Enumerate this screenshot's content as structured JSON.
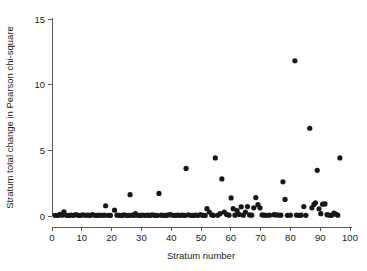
{
  "chart_data": {
    "type": "scatter",
    "title": "",
    "xlabel": "Stratum number",
    "ylabel": "Stratum total change in Pearson chi-square",
    "xlim": [
      0,
      100
    ],
    "ylim": [
      0,
      15
    ],
    "xticks": [
      0,
      10,
      20,
      30,
      40,
      50,
      60,
      70,
      80,
      90,
      100
    ],
    "yticks": [
      0,
      5,
      10,
      15
    ],
    "xtick_labels": [
      "0",
      "10",
      "20",
      "30",
      "40",
      "50",
      "60",
      "70",
      "80",
      "90",
      "100"
    ],
    "ytick_labels": [
      "0",
      "5",
      "10",
      "15"
    ],
    "grid": false,
    "legend": "none",
    "marker": "filled-circle",
    "marker_color": "#171717",
    "marker_size": 2.6,
    "series": [
      {
        "name": "Stratum total change in Pearson chi-square",
        "points": [
          [
            1,
            0.05
          ],
          [
            2,
            0.04
          ],
          [
            2.7,
            0.12
          ],
          [
            3.4,
            0.06
          ],
          [
            4,
            0.32
          ],
          [
            4.8,
            0.05
          ],
          [
            5.6,
            0.04
          ],
          [
            6.4,
            0.07
          ],
          [
            7.2,
            0.05
          ],
          [
            8,
            0.1
          ],
          [
            8.8,
            0.05
          ],
          [
            9.6,
            0.04
          ],
          [
            10.4,
            0.09
          ],
          [
            11.2,
            0.05
          ],
          [
            12,
            0.06
          ],
          [
            12.8,
            0.04
          ],
          [
            13.6,
            0.1
          ],
          [
            14.4,
            0.05
          ],
          [
            15.2,
            0.04
          ],
          [
            16,
            0.07
          ],
          [
            16.8,
            0.05
          ],
          [
            17.6,
            0.06
          ],
          [
            18,
            0.78
          ],
          [
            18.8,
            0.05
          ],
          [
            19.6,
            0.04
          ],
          [
            21,
            0.44
          ],
          [
            21.8,
            0.06
          ],
          [
            22.6,
            0.05
          ],
          [
            23.4,
            0.04
          ],
          [
            24.2,
            0.08
          ],
          [
            25,
            0.05
          ],
          [
            25.8,
            0.04
          ],
          [
            26.2,
            1.62
          ],
          [
            26.9,
            0.06
          ],
          [
            27.6,
            0.05
          ],
          [
            28,
            0.18
          ],
          [
            28.8,
            0.05
          ],
          [
            29.6,
            0.04
          ],
          [
            30.4,
            0.07
          ],
          [
            31.2,
            0.05
          ],
          [
            32,
            0.06
          ],
          [
            32.8,
            0.04
          ],
          [
            33.6,
            0.09
          ],
          [
            34.4,
            0.05
          ],
          [
            35.2,
            0.04
          ],
          [
            35.9,
            1.72
          ],
          [
            36.6,
            0.06
          ],
          [
            37.4,
            0.05
          ],
          [
            38.2,
            0.04
          ],
          [
            39,
            0.08
          ],
          [
            39.8,
            0.11
          ],
          [
            40.6,
            0.05
          ],
          [
            41.4,
            0.04
          ],
          [
            42.2,
            0.07
          ],
          [
            43,
            0.05
          ],
          [
            43.8,
            0.06
          ],
          [
            44.6,
            0.04
          ],
          [
            45,
            3.62
          ],
          [
            45.8,
            0.09
          ],
          [
            46.6,
            0.05
          ],
          [
            47.4,
            0.04
          ],
          [
            48.2,
            0.07
          ],
          [
            49,
            0.05
          ],
          [
            49.8,
            0.1
          ],
          [
            50.6,
            0.05
          ],
          [
            51.4,
            0.04
          ],
          [
            52,
            0.56
          ],
          [
            52.8,
            0.3
          ],
          [
            53.6,
            0.08
          ],
          [
            54.2,
            0.05
          ],
          [
            54.8,
            4.42
          ],
          [
            55.6,
            0.05
          ],
          [
            56.4,
            0.18
          ],
          [
            57,
            2.82
          ],
          [
            57.8,
            0.3
          ],
          [
            58.6,
            0.12
          ],
          [
            59.4,
            0.06
          ],
          [
            60.1,
            1.38
          ],
          [
            60.8,
            0.56
          ],
          [
            61.4,
            0.06
          ],
          [
            62.1,
            0.42
          ],
          [
            62.8,
            0.12
          ],
          [
            63.5,
            0.7
          ],
          [
            64.2,
            0.06
          ],
          [
            64.9,
            0.3
          ],
          [
            65.6,
            0.72
          ],
          [
            66.3,
            0.08
          ],
          [
            67,
            0.06
          ],
          [
            67.7,
            0.62
          ],
          [
            68.4,
            1.4
          ],
          [
            69.1,
            0.86
          ],
          [
            69.8,
            0.62
          ],
          [
            70.5,
            0.08
          ],
          [
            71.2,
            0.06
          ],
          [
            72,
            0.05
          ],
          [
            73,
            0.06
          ],
          [
            74.5,
            0.1
          ],
          [
            75.2,
            0.08
          ],
          [
            76,
            0.07
          ],
          [
            76.8,
            0.06
          ],
          [
            77.5,
            2.6
          ],
          [
            78.2,
            1.26
          ],
          [
            79,
            0.05
          ],
          [
            80,
            0.06
          ],
          [
            81.5,
            11.82
          ],
          [
            82,
            0.07
          ],
          [
            82.8,
            0.05
          ],
          [
            83.6,
            0.06
          ],
          [
            84.5,
            0.72
          ],
          [
            85.2,
            0.05
          ],
          [
            86.5,
            6.68
          ],
          [
            87.2,
            0.62
          ],
          [
            87.9,
            0.88
          ],
          [
            88.4,
            1.0
          ],
          [
            89,
            3.48
          ],
          [
            89.6,
            0.55
          ],
          [
            90.2,
            0.18
          ],
          [
            90.8,
            0.9
          ],
          [
            91.6,
            0.92
          ],
          [
            92.3,
            0.1
          ],
          [
            93,
            0.06
          ],
          [
            93.8,
            0.05
          ],
          [
            94.6,
            0.22
          ],
          [
            95.2,
            0.14
          ],
          [
            95.9,
            0.06
          ],
          [
            96.6,
            4.42
          ]
        ]
      }
    ]
  },
  "geometry": {
    "plot_left": 52,
    "plot_right": 350,
    "plot_baseline": 216,
    "plot_top": 19,
    "x_tick_len": 4,
    "y_tick_len": 4
  }
}
